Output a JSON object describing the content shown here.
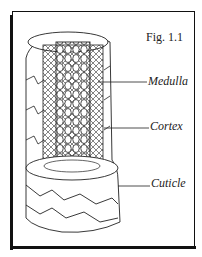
{
  "figure": {
    "caption": "Fig. 1.1",
    "labels": [
      {
        "text": "Medulla",
        "x": 148,
        "y": 74
      },
      {
        "text": "Cortex",
        "x": 150,
        "y": 119
      },
      {
        "text": "Cuticle",
        "x": 151,
        "y": 176
      }
    ]
  }
}
